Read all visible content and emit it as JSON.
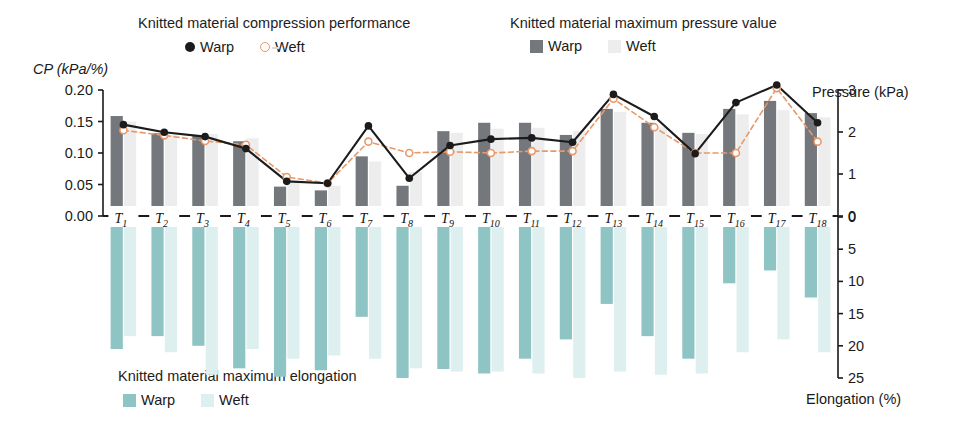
{
  "legends": {
    "top_left": {
      "title": "Knitted material compression performance",
      "series": [
        {
          "name": "Warp",
          "marker": "filled-circle",
          "color": "#1b1b1b"
        },
        {
          "name": "Weft",
          "marker": "open-circle",
          "color": "#e8996a"
        }
      ]
    },
    "top_right": {
      "title": "Knitted material maximum pressure value",
      "series": [
        {
          "name": "Warp",
          "marker": "square",
          "color": "#74787c"
        },
        {
          "name": "Weft",
          "marker": "square",
          "color": "#ededed"
        }
      ]
    },
    "bottom_left": {
      "title": "Knitted material maximum elongation",
      "series": [
        {
          "name": "Warp",
          "marker": "square",
          "color": "#8fc4c4"
        },
        {
          "name": "Weft",
          "marker": "square",
          "color": "#ddefef"
        }
      ]
    }
  },
  "axes": {
    "left_title": "CP (kPa/%)",
    "right_top_title": "Pressure (kPa)",
    "right_bottom_title": "Elongation (%)",
    "left_ticks": [
      "0.20",
      "0.15",
      "0.10",
      "0.05",
      "0.00"
    ],
    "right_top_ticks": [
      "3",
      "2",
      "1",
      "0"
    ],
    "right_bottom_ticks": [
      "0",
      "5",
      "10",
      "15",
      "20",
      "25"
    ]
  },
  "chart_data": {
    "type": "bar",
    "xlabel": "",
    "ylabel": "CP (kPa/%)",
    "ylim": [
      0.0,
      0.2
    ],
    "y2label": "Pressure (kPa)",
    "y2lim": [
      0,
      3
    ],
    "y3label": "Elongation (%)",
    "y3lim": [
      0,
      25
    ],
    "grid": false,
    "legend_position": "top and bottom",
    "categories": [
      "T1",
      "T2",
      "T3",
      "T4",
      "T5",
      "T6",
      "T7",
      "T8",
      "T9",
      "T10",
      "T11",
      "T12",
      "T13",
      "T14",
      "T15",
      "T16",
      "T17",
      "T18"
    ],
    "category_labels_base": [
      "T",
      "T",
      "T",
      "T",
      "T",
      "T",
      "T",
      "T",
      "T",
      "T",
      "T",
      "T",
      "T",
      "T",
      "T",
      "T",
      "T",
      "T"
    ],
    "category_labels_sub": [
      "1",
      "2",
      "3",
      "4",
      "5",
      "6",
      "7",
      "8",
      "9",
      "10",
      "11",
      "12",
      "13",
      "14",
      "15",
      "16",
      "17",
      "18"
    ],
    "series": [
      {
        "name": "Maximum pressure value - Warp",
        "kind": "bar",
        "axis": "y2",
        "unit": "kPa",
        "color": "#74787c",
        "values": [
          2.38,
          1.97,
          1.91,
          1.78,
          0.7,
          0.61,
          1.42,
          0.72,
          2.02,
          2.22,
          2.22,
          1.93,
          2.55,
          2.22,
          1.98,
          2.55,
          2.74,
          2.45
        ]
      },
      {
        "name": "Maximum pressure value - Weft",
        "kind": "bar",
        "axis": "y2",
        "unit": "kPa",
        "color": "#ededed",
        "values": [
          2.25,
          1.93,
          1.95,
          1.85,
          0.8,
          0.72,
          1.3,
          1.05,
          1.98,
          2.08,
          2.1,
          2.02,
          2.48,
          2.12,
          1.95,
          2.42,
          2.52,
          2.35
        ]
      },
      {
        "name": "Compression performance - Warp",
        "kind": "line",
        "axis": "y",
        "unit": "kPa/%",
        "color": "#1b1b1b",
        "marker": "filled-circle",
        "style": "solid",
        "values": [
          0.145,
          0.133,
          0.126,
          0.107,
          0.055,
          0.052,
          0.143,
          0.06,
          0.112,
          0.122,
          0.124,
          0.117,
          0.193,
          0.158,
          0.099,
          0.18,
          0.208,
          0.148
        ]
      },
      {
        "name": "Compression performance - Weft",
        "kind": "line",
        "axis": "y",
        "unit": "kPa/%",
        "color": "#e8996a",
        "marker": "open-circle",
        "style": "dashed",
        "values": [
          0.136,
          0.128,
          0.119,
          0.113,
          0.062,
          0.052,
          0.118,
          0.1,
          0.102,
          0.1,
          0.103,
          0.103,
          0.186,
          0.141,
          0.1,
          0.1,
          0.203,
          0.118
        ]
      },
      {
        "name": "Maximum elongation - Warp",
        "kind": "bar-down",
        "axis": "y3",
        "unit": "%",
        "color": "#8fc4c4",
        "values": [
          20.5,
          18.5,
          20.0,
          23.5,
          24.8,
          23.8,
          15.5,
          25.0,
          23.6,
          24.3,
          22.0,
          19.0,
          13.5,
          18.5,
          22.0,
          10.3,
          8.3,
          12.5
        ]
      },
      {
        "name": "Maximum elongation - Weft",
        "kind": "bar-down",
        "axis": "y3",
        "unit": "%",
        "color": "#ddefef",
        "values": [
          18.5,
          21.0,
          24.5,
          20.5,
          22.0,
          21.5,
          22.0,
          23.5,
          24.0,
          24.0,
          24.3,
          25.0,
          24.0,
          24.5,
          24.3,
          21.0,
          19.0,
          21.0
        ]
      }
    ]
  }
}
